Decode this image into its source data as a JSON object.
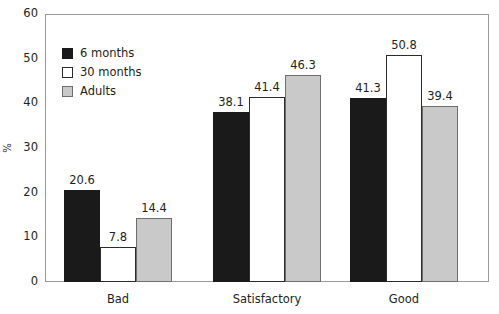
{
  "chart_data": {
    "type": "bar",
    "title": "",
    "subtitle": "",
    "xlabel": "",
    "ylabel": "%",
    "ylim": [
      0,
      60
    ],
    "y_ticks": [
      0,
      10,
      20,
      30,
      40,
      50,
      60
    ],
    "grid": false,
    "legend_position": "top-left-inside",
    "categories": [
      "Bad",
      "Satisfactory",
      "Good"
    ],
    "series": [
      {
        "name": "6 months",
        "values": [
          20.6,
          38.1,
          41.3
        ],
        "color": "#1a1a1a"
      },
      {
        "name": "30 months",
        "values": [
          7.8,
          41.4,
          50.8
        ],
        "color": "#ffffff"
      },
      {
        "name": "Adults",
        "values": [
          14.4,
          46.3,
          39.4
        ],
        "color": "#c9c9c9"
      }
    ],
    "value_labels": [
      [
        "20.6",
        "38.1",
        "41.3"
      ],
      [
        "7.8",
        "41.4",
        "50.8"
      ],
      [
        "14.4",
        "46.3",
        "39.4"
      ]
    ],
    "y_tick_labels": [
      "0",
      "10",
      "20",
      "30",
      "40",
      "50",
      "60"
    ]
  }
}
